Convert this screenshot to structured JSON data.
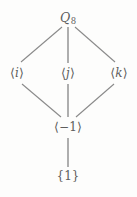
{
  "figure": {
    "kind": "hasse-diagram",
    "caption": "",
    "background_color": "#fdfdfc",
    "edge_color": "#8a8a8a",
    "text_color": "#5d5d5d"
  },
  "nodes": {
    "top": {
      "id": "Q8",
      "base": "Q",
      "subscript": "8",
      "full_label": "Q8",
      "x": 68,
      "y": 18
    },
    "left": {
      "id": "i",
      "open": "⟨",
      "generator": "i",
      "close": "⟩",
      "full_label": "⟨i⟩",
      "x": 17,
      "y": 73
    },
    "middle": {
      "id": "j",
      "open": "⟨",
      "generator": "j",
      "close": "⟩",
      "full_label": "⟨j⟩",
      "x": 68,
      "y": 73
    },
    "right": {
      "id": "k",
      "open": "⟨",
      "generator": "k",
      "close": "⟩",
      "full_label": "⟨k⟩",
      "x": 119,
      "y": 73
    },
    "center_low": {
      "id": "minus-one",
      "open": "⟨",
      "generator": "−1",
      "close": "⟩",
      "full_label": "⟨−1⟩",
      "x": 68,
      "y": 127
    },
    "bottom": {
      "id": "trivial",
      "full_label": "{1}",
      "x": 68,
      "y": 176
    }
  },
  "edges": [
    {
      "id": "q8-to-i",
      "from": "Q8",
      "to": "i",
      "x1": 62,
      "y1": 27,
      "x2": 21,
      "y2": 62
    },
    {
      "id": "q8-to-j",
      "from": "Q8",
      "to": "j",
      "x1": 68,
      "y1": 27,
      "x2": 68,
      "y2": 63
    },
    {
      "id": "q8-to-k",
      "from": "Q8",
      "to": "k",
      "x1": 75,
      "y1": 27,
      "x2": 115,
      "y2": 62
    },
    {
      "id": "i-to-m1",
      "from": "i",
      "to": "minus-one",
      "x1": 22,
      "y1": 84,
      "x2": 61,
      "y2": 117
    },
    {
      "id": "j-to-m1",
      "from": "j",
      "to": "minus-one",
      "x1": 68,
      "y1": 84,
      "x2": 68,
      "y2": 117
    },
    {
      "id": "k-to-m1",
      "from": "k",
      "to": "minus-one",
      "x1": 114,
      "y1": 84,
      "x2": 76,
      "y2": 117
    },
    {
      "id": "m1-to-1",
      "from": "minus-one",
      "to": "trivial",
      "x1": 68,
      "y1": 138,
      "x2": 68,
      "y2": 167
    }
  ]
}
